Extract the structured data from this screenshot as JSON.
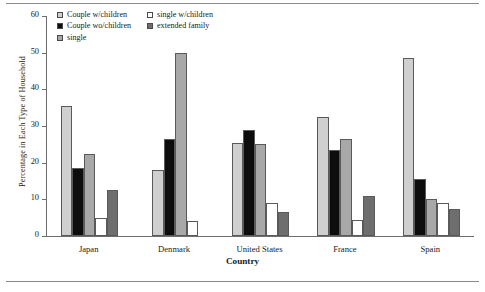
{
  "chart_data": {
    "type": "bar",
    "title": "",
    "xlabel": "Country",
    "ylabel": "Percentage in Each Type of Household",
    "ylim": [
      0,
      60
    ],
    "yticks": [
      0,
      10,
      20,
      30,
      40,
      50,
      60
    ],
    "grid": false,
    "legend_position": "top-left",
    "categories": [
      "Japan",
      "Denmark",
      "United States",
      "France",
      "Spain"
    ],
    "series": [
      {
        "name": "Couple w/children",
        "color": "#cfcfcf",
        "values": [
          35.5,
          18.0,
          25.5,
          32.5,
          48.5
        ]
      },
      {
        "name": "Couple wo/children",
        "color": "#0d0d0d",
        "values": [
          18.5,
          26.5,
          29.0,
          23.5,
          15.5
        ]
      },
      {
        "name": "single",
        "color": "#a8a8a8",
        "values": [
          22.5,
          50.0,
          25.0,
          26.5,
          10.0
        ]
      },
      {
        "name": "single w/children",
        "color": "#ffffff",
        "values": [
          5.0,
          4.0,
          9.0,
          4.5,
          9.0
        ]
      },
      {
        "name": "extended family",
        "color": "#6e6e6e",
        "values": [
          12.5,
          null,
          6.5,
          11.0,
          7.5
        ]
      }
    ],
    "legend_entries": [
      {
        "label": "Couple w/children",
        "color": "#cfcfcf"
      },
      {
        "label": "single w/children",
        "color": "#ffffff"
      },
      {
        "label": "Couple wo/children",
        "color": "#0d0d0d"
      },
      {
        "label": "extended family",
        "color": "#6e6e6e"
      },
      {
        "label": "single",
        "color": "#a8a8a8"
      }
    ]
  }
}
